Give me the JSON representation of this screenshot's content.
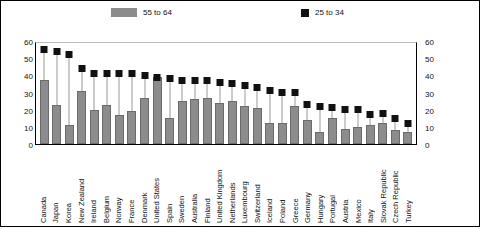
{
  "chart_data": {
    "type": "bar",
    "title": "",
    "xlabel": "",
    "ylabel": "",
    "ylim": [
      0,
      60
    ],
    "yticks": [
      0,
      10,
      20,
      30,
      40,
      50,
      60
    ],
    "grid": false,
    "dual_axis": true,
    "legend_position": "top",
    "legend": [
      {
        "label": "55 to 64",
        "marker": "bar",
        "color": "#8c8c8c"
      },
      {
        "label": "25 to 34",
        "marker": "square",
        "color": "#111111"
      }
    ],
    "categories": [
      "Canada",
      "Japan",
      "Korea",
      "New Zealand",
      "Ireland",
      "Belgium",
      "Norway",
      "France",
      "Denmark",
      "United States",
      "Spain",
      "Sweden",
      "Australia",
      "Finland",
      "United Kingdom",
      "Netherlands",
      "Luxembourg",
      "Switzerland",
      "Iceland",
      "Poland",
      "Greece",
      "Germany",
      "Hungary",
      "Portugal",
      "Austria",
      "Mexico",
      "Italy",
      "Slovak Republic",
      "Czech Republic",
      "Turkey"
    ],
    "series": [
      {
        "name": "55 to 64",
        "type": "bar",
        "values": [
          37,
          23,
          11,
          31,
          20,
          23,
          17,
          19,
          27,
          39,
          15,
          25,
          26,
          27,
          24,
          25,
          22,
          21,
          12,
          12,
          22,
          14,
          7,
          15,
          9,
          10,
          11,
          12,
          8,
          7
        ]
      },
      {
        "name": "25 to 34",
        "type": "scatter",
        "values": [
          55,
          54,
          52,
          44,
          41,
          41,
          41,
          41,
          40,
          39,
          38,
          37,
          37,
          37,
          36,
          35,
          34,
          33,
          31,
          30,
          30,
          23,
          22,
          21,
          20,
          20,
          17,
          18,
          15,
          12
        ]
      }
    ]
  },
  "legend": {
    "bar_label": "55 to 64",
    "square_label": "25 to 34"
  },
  "axis": {
    "left_ticks": [
      "60",
      "50",
      "40",
      "30",
      "20",
      "10",
      "0"
    ],
    "right_ticks": [
      "60",
      "50",
      "40",
      "30",
      "20",
      "10",
      "0"
    ]
  }
}
